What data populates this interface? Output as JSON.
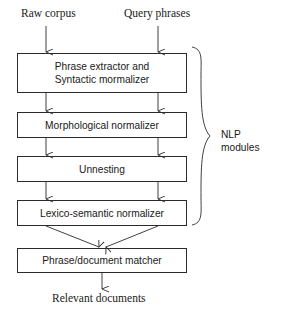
{
  "diagram": {
    "inputs": [
      {
        "id": "raw-corpus",
        "label": "Raw corpus",
        "x": 46
      },
      {
        "id": "query-phrases",
        "label": "Query phrases",
        "x": 158
      }
    ],
    "stages": [
      {
        "id": "phrase-extractor",
        "lines": [
          "Phrase extractor and",
          "Syntactic mormalizer"
        ],
        "top": 53,
        "height": 40
      },
      {
        "id": "morphological-normalizer",
        "lines": [
          "Morphological normalizer"
        ],
        "top": 112,
        "height": 26
      },
      {
        "id": "unnesting",
        "lines": [
          "Unnesting"
        ],
        "top": 156,
        "height": 26
      },
      {
        "id": "lexico-semantic-normalizer",
        "lines": [
          "Lexico-semantic normalizer"
        ],
        "top": 200,
        "height": 26
      },
      {
        "id": "phrase-document-matcher",
        "lines": [
          "Phrase/document matcher"
        ],
        "top": 248,
        "height": 25
      }
    ],
    "group": {
      "id": "nlp-modules",
      "lines": [
        "NLP",
        "modules"
      ]
    },
    "output": {
      "id": "relevant-documents",
      "label": "Relevant documents"
    },
    "colors": {
      "ink": "#2b2b2b",
      "text": "#1a1a1a",
      "background": "#ffffff"
    }
  }
}
